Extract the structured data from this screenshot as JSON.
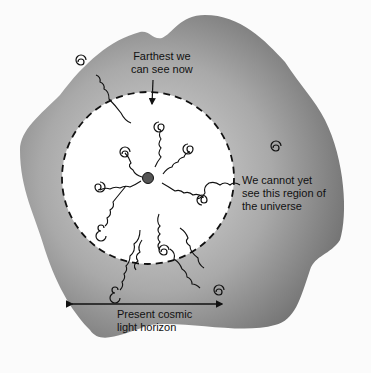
{
  "diagram": {
    "title": "Cosmic light horizon",
    "labels": {
      "farthest": "Farthest we\ncan see now",
      "unseen": "We cannot yet\nsee this region of\nthe universe",
      "horizon": "Present cosmic\nlight horizon"
    },
    "regions": {
      "observable": "Observable region inside present cosmic light horizon",
      "unobservable": "Region of the universe we cannot yet see"
    },
    "elements": {
      "observer": "Observer at center",
      "galaxies_inside": 9,
      "galaxies_outside": 5,
      "light_paths": "Wavy arrows carrying light from galaxies toward the observer"
    },
    "colors": {
      "outer_region_dark": "#6e6e6e",
      "outer_region_light": "#d8d8d8",
      "observable_region": "#ffffff",
      "line": "#111111"
    }
  }
}
